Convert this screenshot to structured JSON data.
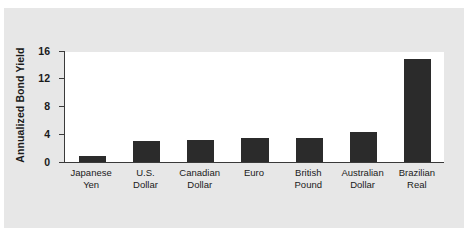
{
  "figure": {
    "panel_background": "#e7e7e7",
    "plot_background": "#ffffff",
    "axis_color": "#3a3a3a",
    "bar_color": "#2b2b2b"
  },
  "chart_data": {
    "type": "bar",
    "title": "",
    "xlabel": "",
    "ylabel": "Annualized Bond Yield",
    "categories": [
      "Japanese\nYen",
      "U.S.\nDollar",
      "Canadian\nDollar",
      "Euro",
      "British\nPound",
      "Australian\nDollar",
      "Brazilian\nReal"
    ],
    "values": [
      0.9,
      3.1,
      3.2,
      3.4,
      3.4,
      4.3,
      14.8
    ],
    "ylim": [
      0,
      16
    ],
    "yticks": [
      0,
      4,
      8,
      12,
      16
    ],
    "ytick_labels": [
      "0",
      "4",
      "8",
      "12",
      "16"
    ],
    "grid": false,
    "legend": false
  }
}
